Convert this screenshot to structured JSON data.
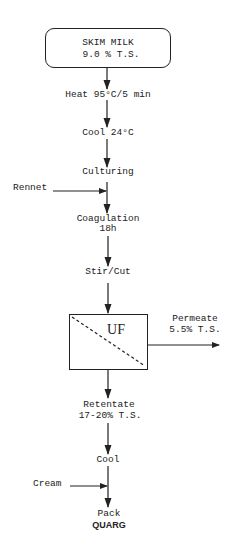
{
  "diagram": {
    "start": {
      "line1": "SKIM MILK",
      "line2": "9.0 % T.S."
    },
    "steps": {
      "heat": "Heat 95°C/5 min",
      "cool1": "Cool 24°C",
      "culturing": "Culturing",
      "coagulation": "Coagulation",
      "coagulation_time": "18h",
      "stir": "Stir/Cut",
      "uf": "UF",
      "retentate": "Retentate",
      "retentate_ts": "17-20% T.S.",
      "cool2": "Cool",
      "pack": "Pack",
      "product": "QUARG"
    },
    "inputs": {
      "rennet": "Rennet",
      "cream": "Cream"
    },
    "outputs": {
      "permeate": "Permeate",
      "permeate_ts": "5.5% T.S."
    }
  }
}
